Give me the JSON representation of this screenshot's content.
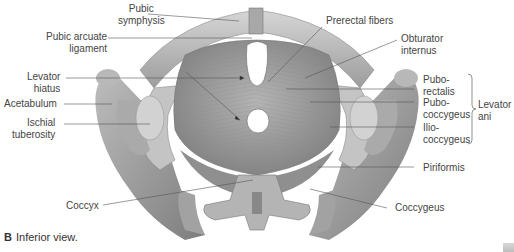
{
  "figure": {
    "caption_letter": "B",
    "caption_text": "Inferior view.",
    "colors": {
      "bone": "#c9c9c9",
      "bone_dark": "#8a8a8a",
      "muscle": "#9e9e9e",
      "muscle_dark": "#6f6f6f",
      "leader_line": "#555555",
      "text": "#444444"
    }
  },
  "labels": {
    "pubic_symphysis": "Pubic symphysis",
    "pubic_symphysis_l1": "Pubic",
    "pubic_symphysis_l2": "symphysis",
    "pubic_arcuate_l1": "Pubic arcuate",
    "pubic_arcuate_l2": "ligament",
    "levator_hiatus_l1": "Levator",
    "levator_hiatus_l2": "hiatus",
    "acetabulum": "Acetabulum",
    "ischial_l1": "Ischial",
    "ischial_l2": "tuberosity",
    "coccyx": "Coccyx",
    "prerectal": "Prerectal fibers",
    "obturator_l1": "Obturator",
    "obturator_l2": "internus",
    "puborectalis_l1": "Pubo-",
    "puborectalis_l2": "rectalis",
    "pubococcygeus_l1": "Pubo-",
    "pubococcygeus_l2": "coccygeus",
    "iliococcygeus_l1": "Ilio-",
    "iliococcygeus_l2": "coccygeus",
    "levator_ani_l1": "Levator",
    "levator_ani_l2": "ani",
    "piriformis": "Piriformis",
    "coccygeus": "Coccygeus"
  }
}
